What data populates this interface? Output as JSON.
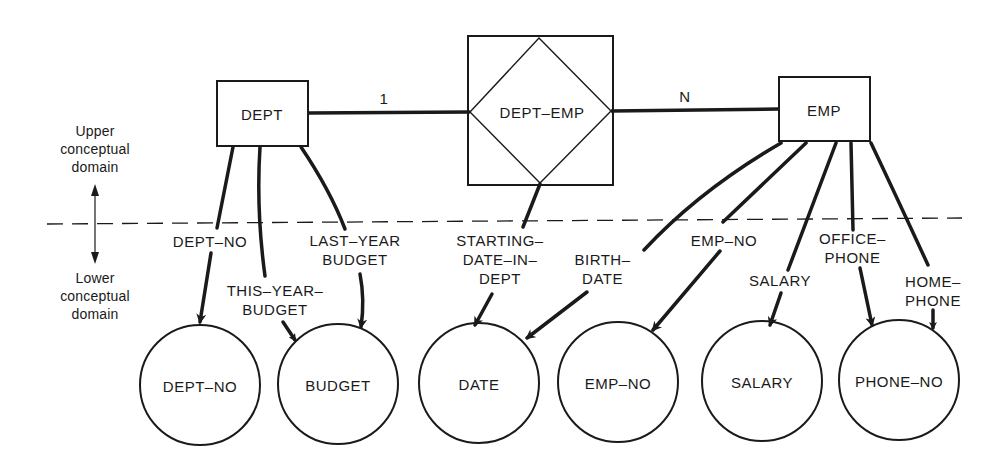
{
  "diagram": {
    "domains": {
      "upper": "Upper\nconceptual\ndomain",
      "lower": "Lower\nconceptual\ndomain"
    },
    "entities": [
      {
        "id": "dept",
        "label": "DEPT"
      },
      {
        "id": "emp",
        "label": "EMP"
      }
    ],
    "relationship": {
      "id": "dept-emp",
      "label": "DEPT–EMP",
      "cardinality_left": "1",
      "cardinality_right": "N"
    },
    "attributes": [
      {
        "id": "dept-no",
        "label": "DEPT–NO",
        "from": "dept",
        "to": "dept-no"
      },
      {
        "id": "this-year-budget",
        "label": "THIS–YEAR–\nBUDGET",
        "from": "dept",
        "to": "budget"
      },
      {
        "id": "last-year-budget",
        "label": "LAST–YEAR\nBUDGET",
        "from": "dept",
        "to": "budget"
      },
      {
        "id": "starting-date-in-dept",
        "label": "STARTING–\nDATE–IN–\nDEPT",
        "from": "dept-emp",
        "to": "date"
      },
      {
        "id": "birth-date",
        "label": "BIRTH–\nDATE",
        "from": "emp",
        "to": "date"
      },
      {
        "id": "emp-no",
        "label": "EMP–NO",
        "from": "emp",
        "to": "emp-no"
      },
      {
        "id": "salary",
        "label": "SALARY",
        "from": "emp",
        "to": "salary"
      },
      {
        "id": "office-phone",
        "label": "OFFICE–\nPHONE",
        "from": "emp",
        "to": "phone-no"
      },
      {
        "id": "home-phone",
        "label": "HOME–\nPHONE",
        "from": "emp",
        "to": "phone-no"
      }
    ],
    "value_sets": [
      {
        "id": "dept-no",
        "label": "DEPT–NO"
      },
      {
        "id": "budget",
        "label": "BUDGET"
      },
      {
        "id": "date",
        "label": "DATE"
      },
      {
        "id": "emp-no",
        "label": "EMP–NO"
      },
      {
        "id": "salary",
        "label": "SALARY"
      },
      {
        "id": "phone-no",
        "label": "PHONE–NO"
      }
    ]
  }
}
